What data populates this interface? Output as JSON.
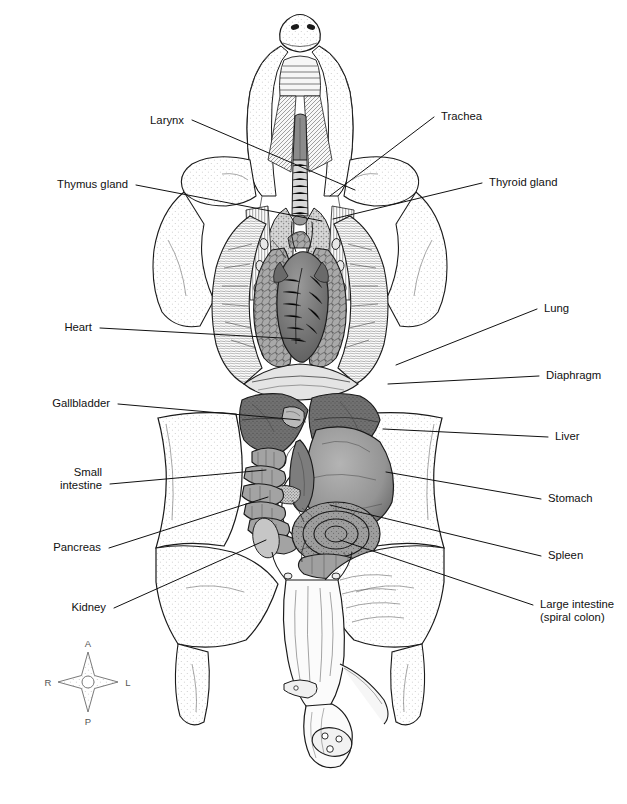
{
  "figure": {
    "background_color": "#ffffff",
    "ink_color": "#1a1a1a",
    "width": 627,
    "height": 804
  },
  "labels_left": [
    {
      "id": "larynx",
      "text": "Larynx",
      "x": 184,
      "y": 124,
      "anchor": "end",
      "leader": "M 192 120 L 355 190"
    },
    {
      "id": "thymus-gland",
      "text": "Thymus gland",
      "x": 128,
      "y": 188,
      "anchor": "end",
      "leader": "M 136 185 L 322 221"
    },
    {
      "id": "heart",
      "text": "Heart",
      "x": 92,
      "y": 331,
      "anchor": "end",
      "leader": "M 100 328 L 300 339"
    },
    {
      "id": "gallbladder",
      "text": "Gallbladder",
      "x": 110,
      "y": 407,
      "anchor": "end",
      "leader": "M 118 404 L 300 420"
    },
    {
      "id": "pancreas",
      "text": "Pancreas",
      "x": 101,
      "y": 551,
      "anchor": "end",
      "leader": "M 109 548 L 268 497"
    },
    {
      "id": "kidney",
      "text": "Kidney",
      "x": 106,
      "y": 611,
      "anchor": "end",
      "leader": "M 114 608 L 266 540"
    }
  ],
  "labels_left_multiline": [
    {
      "id": "small-intestine",
      "lines": [
        "Small",
        "intestine"
      ],
      "x": 102,
      "y": 476,
      "line_height": 13,
      "anchor": "end",
      "leader": "M 110 484 L 266 470"
    }
  ],
  "labels_right": [
    {
      "id": "trachea",
      "text": "Trachea",
      "x": 441,
      "y": 120,
      "anchor": "start",
      "leader": "M 434 117 L 330 196"
    },
    {
      "id": "thyroid-gland",
      "text": "Thyroid gland",
      "x": 489,
      "y": 186,
      "anchor": "start",
      "leader": "M 482 183 L 333 219"
    },
    {
      "id": "lung",
      "text": "Lung",
      "x": 544,
      "y": 312,
      "anchor": "start",
      "leader": "M 537 309 L 396 365"
    },
    {
      "id": "diaphragm",
      "text": "Diaphragm",
      "x": 546,
      "y": 379,
      "anchor": "start",
      "leader": "M 539 376 L 388 384"
    },
    {
      "id": "liver",
      "text": "Liver",
      "x": 555,
      "y": 440,
      "anchor": "start",
      "leader": "M 548 437 L 383 429"
    },
    {
      "id": "stomach",
      "text": "Stomach",
      "x": 548,
      "y": 502,
      "anchor": "start",
      "leader": "M 541 499 L 386 472"
    },
    {
      "id": "spleen",
      "text": "Spleen",
      "x": 548,
      "y": 559,
      "anchor": "start",
      "leader": "M 541 556 L 330 505"
    }
  ],
  "labels_right_multiline": [
    {
      "id": "large-intestine",
      "lines": [
        "Large intestine",
        "(spiral colon)"
      ],
      "x": 540,
      "y": 608,
      "line_height": 13,
      "anchor": "start",
      "leader": "M 533 605 L 340 540"
    }
  ],
  "compass": {
    "id": "orientation-compass",
    "cx": 88,
    "cy": 682,
    "anterior": "A",
    "posterior": "P",
    "right": "R",
    "left": "L",
    "label_color": "#555555"
  }
}
